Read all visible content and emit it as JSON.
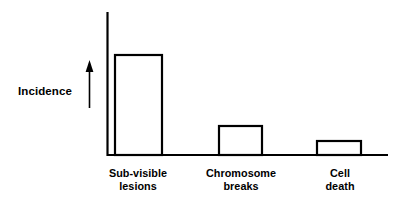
{
  "chart_data": {
    "type": "bar",
    "title": "",
    "subtitle": "",
    "xlabel": "",
    "ylabel": "Incidence",
    "ylabel_arrow": "up-arrow",
    "categories": [
      "Sub-visible lesions",
      "Chromosome breaks",
      "Cell death"
    ],
    "category_lines": [
      [
        "Sub-visible",
        "lesions"
      ],
      [
        "Chromosome",
        "breaks"
      ],
      [
        "Cell",
        "death"
      ]
    ],
    "values": [
      100,
      29,
      14
    ],
    "value_unit": "relative incidence (unlabeled axis)",
    "ylim": [
      0,
      143
    ],
    "grid": false,
    "legend": false,
    "axis_tick_labels": [],
    "colors": {
      "stroke": "#000000",
      "bar_fill": "#ffffff",
      "background": "#ffffff"
    }
  },
  "figure": {
    "axis_label": "Incidence",
    "arrow_icon": "up-arrow-icon",
    "bars": [
      {
        "label_line1": "Sub-visible",
        "label_line2": "lesions"
      },
      {
        "label_line1": "Chromosome",
        "label_line2": "breaks"
      },
      {
        "label_line1": "Cell",
        "label_line2": "death"
      }
    ]
  }
}
